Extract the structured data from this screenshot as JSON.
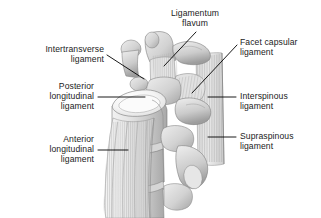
{
  "figure": {
    "background_color": "#ffffff",
    "width": 321,
    "height": 218,
    "style": "grayscale medical line illustration with stipple shading"
  },
  "palette": {
    "text": "#1b1b1b",
    "leader_line": "#000000",
    "bone_light": "#e9e9e9",
    "bone_mid": "#cfcfcf",
    "bone_shadow": "#a9a9a9",
    "bone_dark": "#8f8f8f",
    "outline": "#6e6e6e",
    "ligament_fiber": "#bdbdbd",
    "endplate_white": "#fdfdfd"
  },
  "labels": [
    {
      "id": "ligamentum-flavum",
      "text": "Ligamentum\nflavum",
      "align": "center",
      "x": 152,
      "y": 8,
      "width": 86,
      "leader": {
        "x1": 196,
        "y1": 32,
        "x2": 164,
        "y2": 66
      }
    },
    {
      "id": "intertransverse-ligament",
      "text": "Intertransverse\nligament",
      "align": "right",
      "x": 8,
      "y": 44,
      "width": 96,
      "leader": {
        "x1": 107,
        "y1": 55,
        "x2": 144,
        "y2": 79
      }
    },
    {
      "id": "facet-capsular-ligament",
      "text": "Facet capsular\nligament",
      "align": "left",
      "x": 240,
      "y": 37,
      "width": 80,
      "leader": {
        "x1": 237,
        "y1": 45,
        "x2": 192,
        "y2": 93
      }
    },
    {
      "id": "posterior-longitudinal-ligament",
      "text": "Posterior\nlongitudinal\nligament",
      "align": "right",
      "x": 8,
      "y": 81,
      "width": 86,
      "leader": {
        "x1": 98,
        "y1": 97,
        "x2": 145,
        "y2": 97
      }
    },
    {
      "id": "interspinous-ligament",
      "text": "Interspinous\nligament",
      "align": "left",
      "x": 240,
      "y": 91,
      "width": 78,
      "leader": {
        "x1": 236,
        "y1": 97,
        "x2": 208,
        "y2": 97
      }
    },
    {
      "id": "anterior-longitudinal-ligament",
      "text": "Anterior\nlongitudinal\nligament",
      "align": "right",
      "x": 8,
      "y": 134,
      "width": 86,
      "leader": {
        "x1": 98,
        "y1": 150,
        "x2": 128,
        "y2": 150
      }
    },
    {
      "id": "supraspinous-ligament",
      "text": "Supraspinous\nligament",
      "align": "left",
      "x": 240,
      "y": 131,
      "width": 80,
      "leader": {
        "x1": 236,
        "y1": 137,
        "x2": 208,
        "y2": 137
      }
    }
  ],
  "anatomy": {
    "structures": [
      "superior vertebral body with white endplate rim",
      "middle vertebral body",
      "inferior vertebral body",
      "transverse processes",
      "superior articular processes",
      "spinous processes",
      "intervertebral discs",
      "striated anterior longitudinal ligament fibers",
      "striated interspinous and supraspinous ligament fibers"
    ]
  }
}
